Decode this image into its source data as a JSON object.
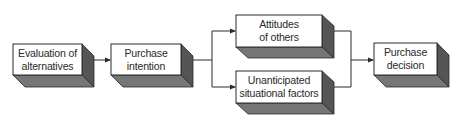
{
  "diagram": {
    "type": "flowchart",
    "colors": {
      "front_face": "#ffffff",
      "side_face": "#5a5a5a",
      "bottom_face": "#7a7a7a",
      "outline": "#2a2a2a",
      "line": "#2a2a2a",
      "text": "#2a2a2a"
    },
    "nodes": [
      {
        "id": "evaluation",
        "lines": [
          "Evaluation of",
          "alternatives"
        ]
      },
      {
        "id": "intention",
        "lines": [
          "Purchase",
          "intention"
        ]
      },
      {
        "id": "attitudes",
        "lines": [
          "Attitudes",
          "of others"
        ]
      },
      {
        "id": "situational",
        "lines": [
          "Unanticipated",
          "situational factors"
        ]
      },
      {
        "id": "decision",
        "lines": [
          "Purchase",
          "decision"
        ]
      }
    ],
    "edges": [
      {
        "from": "evaluation",
        "to": "intention"
      },
      {
        "from": "intention",
        "to": "attitudes"
      },
      {
        "from": "intention",
        "to": "situational"
      },
      {
        "from": "attitudes",
        "to": "decision"
      },
      {
        "from": "situational",
        "to": "decision"
      }
    ]
  }
}
